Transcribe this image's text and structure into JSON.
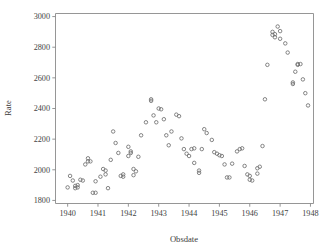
{
  "chart_data": {
    "type": "scatter",
    "title": "",
    "xlabel": "Obsdate",
    "ylabel": "Rate",
    "xlim": [
      1939.6,
      1948.1
    ],
    "ylim": [
      1780,
      3020
    ],
    "xticks": [
      1940,
      1941,
      1942,
      1943,
      1944,
      1945,
      1946,
      1947,
      1948
    ],
    "xticklabels": [
      "1940",
      "1941",
      "1942",
      "1943",
      "1944",
      "1945",
      "1946",
      "1947",
      "1948"
    ],
    "yticks": [
      1800,
      2000,
      2200,
      2400,
      2600,
      2800,
      3000
    ],
    "yticklabels": [
      "1800",
      "2000",
      "2200",
      "2400",
      "2600",
      "2800",
      "3000"
    ],
    "grid": false,
    "legend": null,
    "marker": "open-circle",
    "marker_color": "#6f6f6f",
    "axis_color": "#8a8a8a",
    "background": "#ffffff",
    "series": [
      {
        "name": "Rate",
        "points": [
          [
            1940.0,
            1885
          ],
          [
            1940.08,
            1960
          ],
          [
            1940.17,
            1930
          ],
          [
            1940.25,
            1895
          ],
          [
            1940.25,
            1880
          ],
          [
            1940.33,
            1900
          ],
          [
            1940.33,
            1885
          ],
          [
            1940.42,
            1935
          ],
          [
            1940.5,
            1930
          ],
          [
            1940.58,
            2035
          ],
          [
            1940.67,
            2075
          ],
          [
            1940.67,
            2055
          ],
          [
            1940.75,
            2055
          ],
          [
            1940.83,
            1850
          ],
          [
            1940.92,
            1850
          ],
          [
            1940.92,
            1925
          ],
          [
            1941.08,
            1955
          ],
          [
            1941.17,
            2005
          ],
          [
            1941.25,
            1995
          ],
          [
            1941.25,
            1970
          ],
          [
            1941.33,
            1880
          ],
          [
            1941.42,
            2065
          ],
          [
            1941.5,
            2250
          ],
          [
            1941.58,
            2175
          ],
          [
            1941.67,
            2110
          ],
          [
            1941.75,
            1960
          ],
          [
            1941.83,
            1955
          ],
          [
            1941.83,
            1970
          ],
          [
            1942.0,
            2150
          ],
          [
            1942.0,
            2090
          ],
          [
            1942.08,
            2120
          ],
          [
            1942.08,
            2110
          ],
          [
            1942.17,
            1965
          ],
          [
            1942.17,
            2005
          ],
          [
            1942.25,
            1990
          ],
          [
            1942.33,
            2085
          ],
          [
            1942.42,
            2225
          ],
          [
            1942.58,
            2310
          ],
          [
            1942.75,
            2460
          ],
          [
            1942.75,
            2450
          ],
          [
            1942.83,
            2355
          ],
          [
            1942.92,
            2310
          ],
          [
            1943.0,
            2400
          ],
          [
            1943.08,
            2395
          ],
          [
            1943.17,
            2330
          ],
          [
            1943.25,
            2225
          ],
          [
            1943.33,
            2160
          ],
          [
            1943.42,
            2250
          ],
          [
            1943.58,
            2360
          ],
          [
            1943.67,
            2350
          ],
          [
            1943.75,
            2205
          ],
          [
            1943.83,
            2135
          ],
          [
            1943.92,
            2105
          ],
          [
            1944.0,
            2090
          ],
          [
            1944.08,
            2135
          ],
          [
            1944.17,
            2140
          ],
          [
            1944.17,
            2045
          ],
          [
            1944.33,
            1980
          ],
          [
            1944.33,
            1995
          ],
          [
            1944.42,
            2135
          ],
          [
            1944.5,
            2265
          ],
          [
            1944.58,
            2240
          ],
          [
            1944.75,
            2195
          ],
          [
            1944.83,
            2115
          ],
          [
            1944.92,
            2105
          ],
          [
            1945.0,
            2095
          ],
          [
            1945.08,
            2090
          ],
          [
            1945.17,
            2035
          ],
          [
            1945.25,
            1950
          ],
          [
            1945.33,
            1950
          ],
          [
            1945.42,
            2040
          ],
          [
            1945.58,
            2120
          ],
          [
            1945.67,
            2135
          ],
          [
            1945.75,
            2140
          ],
          [
            1945.83,
            2025
          ],
          [
            1945.92,
            1970
          ],
          [
            1946.0,
            1960
          ],
          [
            1946.0,
            1935
          ],
          [
            1946.08,
            1930
          ],
          [
            1946.25,
            2010
          ],
          [
            1946.25,
            1975
          ],
          [
            1946.33,
            2020
          ],
          [
            1946.42,
            2155
          ],
          [
            1946.5,
            2460
          ],
          [
            1946.58,
            2685
          ],
          [
            1946.75,
            2880
          ],
          [
            1946.75,
            2900
          ],
          [
            1946.83,
            2885
          ],
          [
            1946.83,
            2865
          ],
          [
            1946.92,
            2935
          ],
          [
            1947.0,
            2905
          ],
          [
            1947.0,
            2855
          ],
          [
            1947.17,
            2825
          ],
          [
            1947.25,
            2765
          ],
          [
            1947.42,
            2570
          ],
          [
            1947.42,
            2560
          ],
          [
            1947.5,
            2640
          ],
          [
            1947.58,
            2685
          ],
          [
            1947.58,
            2690
          ],
          [
            1947.67,
            2690
          ],
          [
            1947.75,
            2590
          ],
          [
            1947.83,
            2500
          ],
          [
            1947.92,
            2420
          ]
        ]
      }
    ]
  }
}
